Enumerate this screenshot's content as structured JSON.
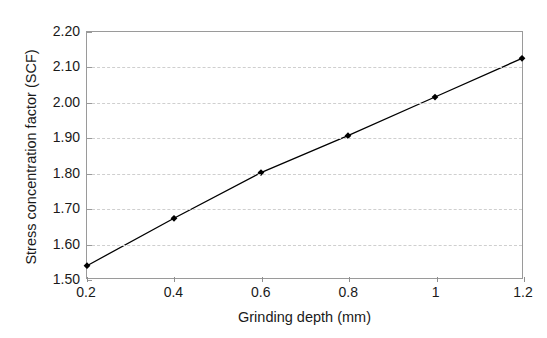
{
  "figure": {
    "background_color": "#ffffff",
    "top_cut_text": "",
    "plot_border_color": "#9a9a9a",
    "gridline_color": "#cfcfcf",
    "series_color": "#000000"
  },
  "chart_data": {
    "type": "line",
    "title": "",
    "xlabel": "Grinding depth (mm)",
    "ylabel": "Stress concentration factor (SCF)",
    "xlim": [
      0.2,
      1.2
    ],
    "ylim": [
      1.5,
      2.2
    ],
    "grid": "horizontal-dashed",
    "legend": "none",
    "marker": "diamond",
    "x": [
      0.2,
      0.4,
      0.6,
      0.8,
      1.0,
      1.2
    ],
    "y": [
      1.535,
      1.67,
      1.8,
      1.905,
      2.015,
      2.125
    ],
    "series": [
      {
        "name": "Stress concentration factor",
        "x": [
          0.2,
          0.4,
          0.6,
          0.8,
          1.0,
          1.2
        ],
        "values": [
          1.535,
          1.67,
          1.8,
          1.905,
          2.015,
          2.125
        ]
      }
    ],
    "x_ticks": [
      0.2,
      0.4,
      0.6,
      0.8,
      1.0,
      1.2
    ],
    "x_tick_labels": [
      "0.2",
      "0.4",
      "0.6",
      "0.8",
      "1",
      "1.2"
    ],
    "y_ticks": [
      1.5,
      1.6,
      1.7,
      1.8,
      1.9,
      2.0,
      2.1,
      2.2
    ],
    "y_tick_labels": [
      "1.50",
      "1.60",
      "1.70",
      "1.80",
      "1.90",
      "2.00",
      "2.10",
      "2.20"
    ]
  }
}
